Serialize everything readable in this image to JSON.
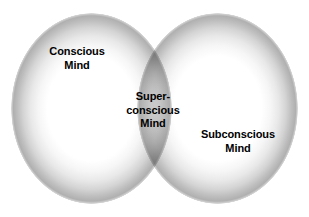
{
  "diagram": {
    "type": "venn-diagram",
    "title": "",
    "background_color": "#ffffff",
    "text_color": "#000000",
    "shading_color": "#b0b0b0",
    "regions": [
      {
        "id": "conscious",
        "position": "left",
        "lines": [
          "Conscious",
          "Mind"
        ]
      },
      {
        "id": "superconscious",
        "position": "overlap",
        "lines": [
          "Super-",
          "conscious",
          "Mind"
        ]
      },
      {
        "id": "subconscious",
        "position": "right",
        "lines": [
          "Subconscious",
          "Mind"
        ]
      }
    ]
  }
}
